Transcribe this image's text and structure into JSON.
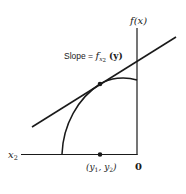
{
  "diagram": {
    "type": "tangent-line-on-concave-curve",
    "labels": {
      "y_axis": "f(x)",
      "x_axis": "x",
      "x_axis_sub": "2",
      "origin": "0",
      "slope_prefix": "Slope = ",
      "slope_f": "f",
      "slope_sub_x": "x",
      "slope_sub_2": "2",
      "slope_arg": "(y)",
      "point_open": "(y",
      "point_sub1": "1",
      "point_mid": ", y",
      "point_sub2": "2",
      "point_close": ")"
    },
    "colors": {
      "stroke": "#1a1a1a",
      "background": "#ffffff"
    }
  }
}
